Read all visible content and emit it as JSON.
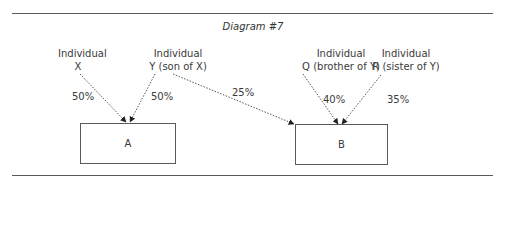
{
  "diagram": {
    "title": "Diagram #7",
    "sources": [
      {
        "id": "X",
        "line1": "Individual",
        "line2": "X"
      },
      {
        "id": "Y",
        "line1": "Individual",
        "line2": "Y (son of X)"
      },
      {
        "id": "Q",
        "line1": "Individual",
        "line2": "Q (brother of Y)"
      },
      {
        "id": "R",
        "line1": "Individual",
        "line2": "R (sister of Y)"
      }
    ],
    "targets": [
      {
        "id": "A",
        "label": "A"
      },
      {
        "id": "B",
        "label": "B"
      }
    ],
    "edges": [
      {
        "from": "X",
        "to": "A",
        "label": "50%"
      },
      {
        "from": "Y",
        "to": "A",
        "label": "50%"
      },
      {
        "from": "Y",
        "to": "B",
        "label": "25%"
      },
      {
        "from": "Q",
        "to": "B",
        "label": "40%"
      },
      {
        "from": "R",
        "to": "B",
        "label": "35%"
      }
    ],
    "colors": {
      "line": "#5a5a5a",
      "text": "#3a3a3a"
    }
  }
}
